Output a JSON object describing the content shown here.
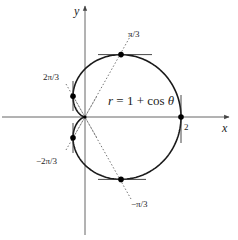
{
  "figure": {
    "equation": "r = 1 + cos θ",
    "equation_parts": {
      "r": "r",
      "eq": " = 1 + cos ",
      "theta": "θ"
    },
    "axes": {
      "x_label": "x",
      "y_label": "y",
      "x_tick_label": "2"
    },
    "angle_labels": {
      "pi_over_3": "π/3",
      "two_pi_over_3": "2π/3",
      "neg_two_pi_over_3": "−2π/3",
      "neg_pi_over_3": "−π/3"
    },
    "colors": {
      "curve": "#1a1a1a",
      "axis": "#555555",
      "dotted": "#666666",
      "point": "#000000"
    }
  }
}
